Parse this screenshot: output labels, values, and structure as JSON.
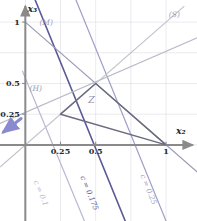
{
  "figure": {
    "kind": "linear-programming-feasible-region",
    "background_color": "#ffffff"
  },
  "axes": {
    "x_axis_label": "x₂",
    "y_axis_label": "x₃",
    "axis_color": "#8a8a8a",
    "grid_color": "#dcdce4",
    "xlim": [
      -0.18,
      1.22
    ],
    "ylim": [
      -0.62,
      1.18
    ],
    "x_ticks": [
      {
        "value": 0.25,
        "label": "0.25"
      },
      {
        "value": 0.5,
        "label": "0.5"
      },
      {
        "value": 1.0,
        "label": "1"
      }
    ],
    "y_ticks": [
      {
        "value": 0.25,
        "label": "0.25"
      },
      {
        "value": 0.5,
        "label": "0.5"
      },
      {
        "value": 1.0,
        "label": "1"
      }
    ]
  },
  "constraint_lines": [
    {
      "name": "M",
      "label": "(M)",
      "color": "#9a9ab4",
      "from": [
        0.0,
        1.0
      ],
      "to": [
        1.222,
        -0.222
      ],
      "label_pos": [
        0.1,
        0.98
      ]
    },
    {
      "name": "H",
      "label": "(H)",
      "color": "#b9b9c9",
      "from": [
        -0.18,
        0.175
      ],
      "to": [
        1.222,
        0.872
      ],
      "label_pos": [
        0.03,
        0.435
      ]
    },
    {
      "name": "S",
      "label": "(S)",
      "color": "#c2c2cf",
      "from": [
        -0.18,
        -0.18
      ],
      "to": [
        1.13,
        1.13
      ],
      "label_pos": [
        1.02,
        1.04
      ]
    }
  ],
  "feasible_region": {
    "label": "Z",
    "label_pos": [
      0.47,
      0.345
    ],
    "label_color": "#8f8fa8",
    "edge_color": "#6b6b80",
    "fill_color": "rgba(255,255,255,0)",
    "vertices": [
      [
        0.25,
        0.25
      ],
      [
        0.5,
        0.5
      ],
      [
        1.0,
        0.0
      ]
    ]
  },
  "objective_lines": [
    {
      "label": "c = 0.1",
      "c_value": 0.1,
      "color": "#b8b8d4",
      "label_pos": [
        0.095,
        -0.4
      ],
      "from": [
        -0.02,
        0.6
      ],
      "to": [
        0.42,
        -0.62
      ]
    },
    {
      "label": "c = 0.175",
      "c_value": 0.175,
      "color": "#5a5a96",
      "label_pos": [
        0.44,
        -0.4
      ],
      "from": [
        0.07,
        1.18
      ],
      "to": [
        0.71,
        -0.62
      ]
    },
    {
      "label": "c = 0.25",
      "c_value": 0.25,
      "color": "#9f9fc6",
      "label_pos": [
        0.86,
        -0.37
      ],
      "from": [
        0.36,
        1.18
      ],
      "to": [
        1.0,
        -0.62
      ]
    }
  ],
  "gradient_arrow": {
    "name": "descent-direction-arrow",
    "color": "#8a8ad0",
    "from": [
      -0.03,
      0.215
    ],
    "to": [
      -0.155,
      0.105
    ]
  }
}
